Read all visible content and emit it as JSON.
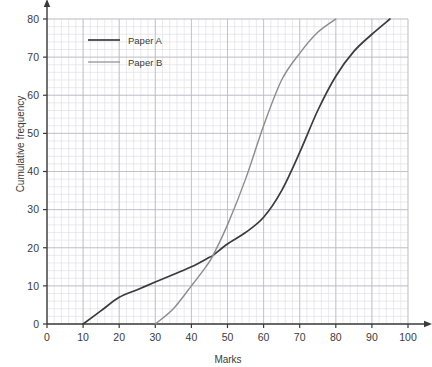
{
  "chart_data": {
    "type": "line",
    "title": "",
    "xlabel": "Marks",
    "ylabel": "Cumulative frequency",
    "xlim": [
      0,
      100
    ],
    "ylim": [
      0,
      80
    ],
    "xticks": [
      0,
      10,
      20,
      30,
      40,
      50,
      60,
      70,
      80,
      90,
      100
    ],
    "yticks": [
      0,
      10,
      20,
      30,
      40,
      50,
      60,
      70,
      80
    ],
    "grid": true,
    "grid_minor": true,
    "legend_position": "top-left",
    "series": [
      {
        "name": "Paper A",
        "color": "#3b3b3b",
        "x": [
          10,
          15,
          20,
          25,
          30,
          35,
          40,
          45,
          46,
          50,
          55,
          60,
          65,
          70,
          75,
          80,
          85,
          90,
          95
        ],
        "y": [
          0,
          3.5,
          7,
          9,
          11,
          13,
          15,
          17.5,
          18,
          21,
          24,
          28,
          35,
          45,
          56,
          65,
          71.5,
          76,
          80
        ]
      },
      {
        "name": "Paper B",
        "color": "#8c8c8c",
        "x": [
          30,
          35,
          40,
          44,
          46,
          50,
          55,
          60,
          65,
          70,
          75,
          80
        ],
        "y": [
          0,
          4,
          10,
          15,
          18,
          26,
          38,
          52,
          64,
          71,
          76.5,
          80
        ]
      }
    ]
  },
  "legend": {
    "entries": [
      {
        "label": "Paper A"
      },
      {
        "label": "Paper B"
      }
    ]
  },
  "colors": {
    "paper_a": "#3b3b3b",
    "paper_b": "#8c8c8c",
    "axis": "#3a3a3a",
    "grid_major": "#b9b9c4",
    "grid_minor": "#dcdce4",
    "background": "#ffffff"
  }
}
